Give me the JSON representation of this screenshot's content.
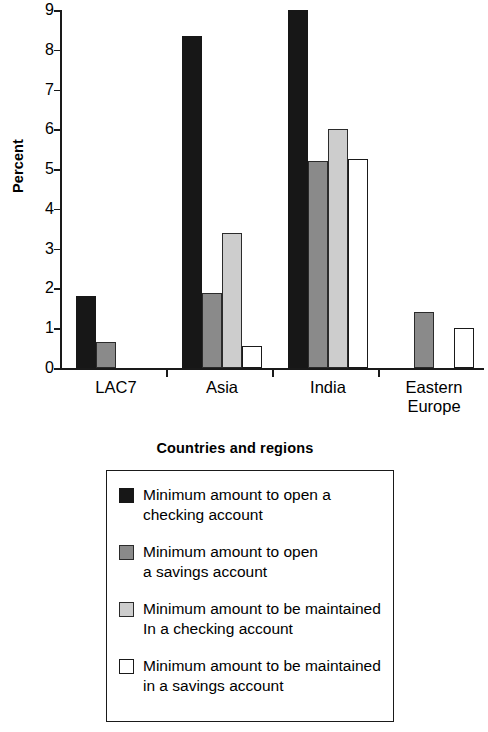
{
  "chart_data": {
    "type": "bar",
    "title": "",
    "xlabel": "Countries and regions",
    "ylabel": "Percent",
    "categories": [
      "LAC7",
      "Asia",
      "India",
      "Eastern\nEurope"
    ],
    "ylim": [
      0,
      9
    ],
    "ytick_labels": [
      "0",
      "1",
      "2",
      "3",
      "4",
      "5",
      "6",
      "7",
      "8",
      "9"
    ],
    "yticks": [
      0,
      1,
      2,
      3,
      4,
      5,
      6,
      7,
      8,
      9
    ],
    "grid": false,
    "legend_position": "below-plot",
    "series": [
      {
        "name": "Minimum amount to open a\nchecking account",
        "color": "#171717",
        "swatch": "black",
        "values": [
          1.8,
          8.35,
          9.0,
          null
        ]
      },
      {
        "name": "Minimum amount to open\na savings account",
        "color": "#8a8a8a",
        "swatch": "gray",
        "values": [
          0.65,
          1.88,
          5.2,
          1.4
        ]
      },
      {
        "name": "Minimum amount to be maintained\nIn a checking account",
        "color": "#cdcdcd",
        "swatch": "ltgray",
        "values": [
          null,
          3.4,
          6.0,
          null
        ]
      },
      {
        "name": "Minimum amount to be maintained\nin a savings account",
        "color": "#ffffff",
        "swatch": "white",
        "values": [
          null,
          0.55,
          5.25,
          1.0
        ]
      }
    ]
  },
  "axis": {
    "y_title": "Percent",
    "x_title": "Countries and regions"
  },
  "legend": {
    "items": [
      {
        "label": "Minimum amount to open a\nchecking account",
        "swatch": "black"
      },
      {
        "label": "Minimum amount to open\na savings account",
        "swatch": "gray"
      },
      {
        "label": "Minimum amount to be maintained\nIn a checking account",
        "swatch": "ltgray"
      },
      {
        "label": "Minimum amount to be maintained\nin a savings account",
        "swatch": "white"
      }
    ]
  }
}
